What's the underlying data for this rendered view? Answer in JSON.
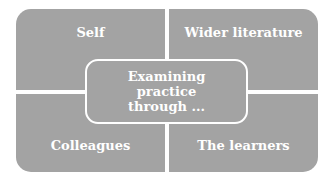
{
  "diagram": {
    "center": {
      "lines": [
        "Examining",
        "practice",
        "through ..."
      ]
    },
    "quadrants": {
      "top_left": "Self",
      "top_right": "Wider literature",
      "bottom_left": "Colleagues",
      "bottom_right": "The learners"
    },
    "colors": {
      "fill": "#a3a3a3",
      "text": "#ffffff",
      "background": "#ffffff"
    }
  }
}
